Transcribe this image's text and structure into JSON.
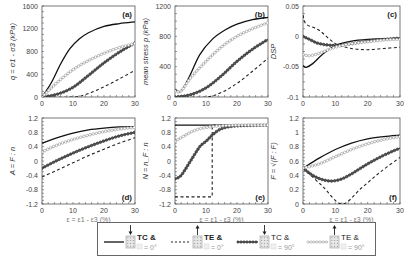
{
  "figure": {
    "legend": {
      "items": [
        {
          "style": "solid",
          "label_line1": "TC &",
          "label_line2": "= 0°",
          "arrow": "down"
        },
        {
          "style": "dashed",
          "label_line1": "TE &",
          "label_line2": "= 0°",
          "arrow": "up"
        },
        {
          "style": "dark-markers",
          "label_line1": "TC &",
          "label_line2": "= 90°",
          "arrow": "down"
        },
        {
          "style": "light-markers",
          "label_line1": "TE &",
          "label_line2": "= 90°",
          "arrow": "up"
        }
      ]
    }
  },
  "chart_data": [
    {
      "panel": "(a)",
      "type": "line",
      "ylabel": "q = σ1 - σ3 (kPa)",
      "xlabel": "",
      "xlim": [
        0,
        30
      ],
      "ylim": [
        0,
        1600
      ],
      "xticks": [
        0,
        10,
        20,
        30
      ],
      "yticks": [
        0,
        400,
        800,
        1200,
        1600
      ],
      "series": [
        {
          "name": "TC & θ = 0°",
          "x": [
            0,
            3,
            6,
            9,
            12,
            15,
            20,
            25,
            30
          ],
          "values": [
            0,
            250,
            580,
            850,
            1020,
            1130,
            1240,
            1290,
            1320
          ]
        },
        {
          "name": "TE & θ = 0°",
          "x": [
            0,
            10,
            15,
            20,
            25,
            30
          ],
          "values": [
            0,
            0,
            60,
            180,
            320,
            470
          ]
        },
        {
          "name": "TC & θ = 90°",
          "x": [
            0,
            5,
            10,
            15,
            20,
            25,
            30
          ],
          "values": [
            0,
            50,
            170,
            380,
            600,
            790,
            950
          ]
        },
        {
          "name": "TE & θ = 90°",
          "x": [
            0,
            5,
            10,
            15,
            20,
            25,
            30
          ],
          "values": [
            0,
            260,
            480,
            640,
            770,
            870,
            940
          ]
        }
      ]
    },
    {
      "panel": "(b)",
      "type": "line",
      "ylabel": "mean stress p (kPa)",
      "xlabel": "",
      "xlim": [
        0,
        30
      ],
      "ylim": [
        0,
        1200
      ],
      "xticks": [
        0,
        10,
        20,
        30
      ],
      "yticks": [
        0,
        400,
        800,
        1200
      ],
      "series": [
        {
          "name": "TC & θ = 0°",
          "x": [
            0,
            2,
            5,
            8,
            12,
            16,
            20,
            25,
            30
          ],
          "values": [
            100,
            80,
            300,
            560,
            760,
            880,
            960,
            1020,
            1050
          ]
        },
        {
          "name": "TE & θ = 0°",
          "x": [
            0,
            10,
            15,
            20,
            25,
            30
          ],
          "values": [
            0,
            0,
            60,
            180,
            340,
            510
          ]
        },
        {
          "name": "TC & θ = 90°",
          "x": [
            0,
            5,
            10,
            15,
            20,
            25,
            30
          ],
          "values": [
            0,
            30,
            120,
            280,
            470,
            630,
            760
          ]
        },
        {
          "name": "TE & θ = 90°",
          "x": [
            0,
            2,
            5,
            10,
            15,
            20,
            25,
            30
          ],
          "values": [
            80,
            80,
            250,
            470,
            660,
            800,
            900,
            980
          ]
        }
      ]
    },
    {
      "panel": "(c)",
      "type": "line",
      "ylabel": "DSP",
      "xlabel": "",
      "xlim": [
        0,
        30
      ],
      "ylim": [
        -0.1,
        0.05
      ],
      "xticks": [
        0,
        10,
        20,
        30
      ],
      "yticks": [
        -0.1,
        -0.05,
        0,
        0.05
      ],
      "series": [
        {
          "name": "TC & θ = 0°",
          "x": [
            0,
            1,
            3,
            6,
            10,
            15,
            20,
            25,
            30
          ],
          "values": [
            -0.048,
            -0.051,
            -0.045,
            -0.03,
            -0.015,
            -0.008,
            -0.005,
            -0.004,
            -0.003
          ]
        },
        {
          "name": "TE & θ = 0°",
          "x": [
            0,
            1,
            5,
            10,
            15,
            20,
            25,
            30
          ],
          "values": [
            0.035,
            0.02,
            0.01,
            -0.012,
            -0.02,
            -0.022,
            -0.02,
            -0.018
          ]
        },
        {
          "name": "TC & θ = 90°",
          "x": [
            0,
            2,
            5,
            10,
            15,
            20,
            25,
            30
          ],
          "values": [
            0,
            -0.005,
            -0.012,
            -0.015,
            -0.012,
            -0.008,
            -0.005,
            -0.003
          ]
        },
        {
          "name": "TE & θ = 90°",
          "x": [
            0,
            2,
            5,
            10,
            15,
            20,
            25,
            30
          ],
          "values": [
            -0.03,
            -0.032,
            -0.028,
            -0.018,
            -0.012,
            -0.009,
            -0.006,
            -0.005
          ]
        }
      ]
    },
    {
      "panel": "(d)",
      "type": "line",
      "ylabel": "A = F : n",
      "xlabel": "ε = ε1 - ε3 (%)",
      "xlim": [
        0,
        30
      ],
      "ylim": [
        -1.2,
        1.2
      ],
      "xticks": [
        0,
        10,
        20,
        30
      ],
      "yticks": [
        -1.2,
        -0.8,
        -0.4,
        0,
        0.4,
        0.8,
        1.2
      ],
      "series": [
        {
          "name": "TC & θ = 0°",
          "x": [
            0,
            5,
            10,
            15,
            20,
            25,
            30
          ],
          "values": [
            0.5,
            0.65,
            0.78,
            0.87,
            0.92,
            0.95,
            0.96
          ]
        },
        {
          "name": "TE & θ = 0°",
          "x": [
            0,
            5,
            10,
            15,
            20,
            25,
            30
          ],
          "values": [
            -0.45,
            -0.25,
            -0.05,
            0.15,
            0.33,
            0.5,
            0.65
          ]
        },
        {
          "name": "TC & θ = 90°",
          "x": [
            0,
            5,
            10,
            15,
            20,
            25,
            30
          ],
          "values": [
            -0.2,
            0.02,
            0.22,
            0.4,
            0.56,
            0.7,
            0.8
          ]
        },
        {
          "name": "TE & θ = 90°",
          "x": [
            0,
            5,
            10,
            15,
            20,
            25,
            30
          ],
          "values": [
            0.25,
            0.45,
            0.6,
            0.72,
            0.82,
            0.89,
            0.94
          ]
        }
      ]
    },
    {
      "panel": "(e)",
      "type": "line",
      "ylabel": "N = n_F : n",
      "xlabel": "ε = ε1 - ε3 (%)",
      "xlim": [
        0,
        30
      ],
      "ylim": [
        -1.2,
        1.2
      ],
      "xticks": [
        0,
        10,
        20,
        30
      ],
      "yticks": [
        -1.2,
        -0.8,
        -0.4,
        0,
        0.4,
        0.8,
        1.2
      ],
      "series": [
        {
          "name": "TC & θ = 0°",
          "x": [
            0,
            30
          ],
          "values": [
            1.0,
            1.0
          ]
        },
        {
          "name": "TE & θ = 0°",
          "x": [
            0,
            12,
            12,
            30
          ],
          "values": [
            -1.0,
            -1.0,
            1.0,
            1.0
          ]
        },
        {
          "name": "TC & θ = 90°",
          "x": [
            0,
            2,
            5,
            8,
            10,
            12,
            15,
            20,
            30
          ],
          "values": [
            -0.5,
            -0.4,
            0,
            0.4,
            0.55,
            0.72,
            0.9,
            0.98,
            1.0
          ]
        },
        {
          "name": "TE & θ = 90°",
          "x": [
            0,
            2,
            5,
            8,
            12,
            15,
            20,
            30
          ],
          "values": [
            0.55,
            0.65,
            0.8,
            0.9,
            0.96,
            0.98,
            1.0,
            1.0
          ]
        }
      ]
    },
    {
      "panel": "(f)",
      "type": "line",
      "ylabel": "F = √(F : F)",
      "xlabel": "ε = ε1 - ε3 (%)",
      "xlim": [
        0,
        30
      ],
      "ylim": [
        0,
        1.2
      ],
      "xticks": [
        0,
        10,
        20,
        30
      ],
      "yticks": [
        0,
        0.2,
        0.4,
        0.6,
        0.8,
        1,
        1.2
      ],
      "series": [
        {
          "name": "TC & θ = 0°",
          "x": [
            0,
            5,
            10,
            15,
            20,
            25,
            30
          ],
          "values": [
            0.5,
            0.64,
            0.76,
            0.85,
            0.91,
            0.94,
            0.96
          ]
        },
        {
          "name": "TE & θ = 0°",
          "x": [
            0,
            6,
            12,
            18,
            24,
            30
          ],
          "values": [
            0.5,
            0.25,
            0.0,
            0.22,
            0.45,
            0.65
          ]
        },
        {
          "name": "TC & θ = 90°",
          "x": [
            0,
            3,
            6,
            9,
            12,
            15,
            20,
            25,
            30
          ],
          "values": [
            0.5,
            0.4,
            0.34,
            0.32,
            0.35,
            0.42,
            0.56,
            0.68,
            0.78
          ]
        },
        {
          "name": "TE & θ = 90°",
          "x": [
            0,
            5,
            10,
            15,
            20,
            25,
            30
          ],
          "values": [
            0.5,
            0.56,
            0.66,
            0.76,
            0.84,
            0.9,
            0.94
          ]
        }
      ]
    }
  ]
}
